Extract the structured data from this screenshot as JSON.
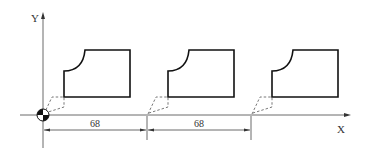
{
  "diagram": {
    "axis_labels": {
      "x": "X",
      "y": "Y"
    },
    "origin_symbol": "workpiece-zero-marker",
    "part_count": 3,
    "dimensions": [
      {
        "label": "68",
        "from_part": 1,
        "to_part": 2
      },
      {
        "label": "68",
        "from_part": 2,
        "to_part": 3
      }
    ],
    "part_shape": "rectangle-with-concave-arc-corner",
    "tool_path_style": "dashed"
  }
}
